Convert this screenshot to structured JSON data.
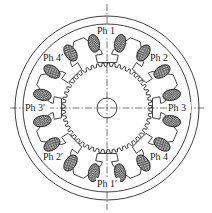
{
  "diagram": {
    "type": "four-phase stepper motor cross-section",
    "labels": {
      "ph1": "Ph 1",
      "ph1p": "Ph 1′",
      "ph2": "Ph 2",
      "ph2p": "Ph 2′",
      "ph3": "Ph 3",
      "ph3p": "Ph 3′",
      "ph4": "Ph 4",
      "ph4p": "Ph 4′"
    },
    "colors": {
      "line": "#2a2a2a",
      "background": "#ffffff",
      "coil_fill": "#8a8a8a"
    },
    "geometry": {
      "center": [
        107,
        108
      ],
      "outer_radius": 92,
      "inner_frame_radius": 84,
      "rotor_radius": 45,
      "rotor_teeth": 50,
      "shaft_radius": 10,
      "stator_poles": 8
    }
  }
}
